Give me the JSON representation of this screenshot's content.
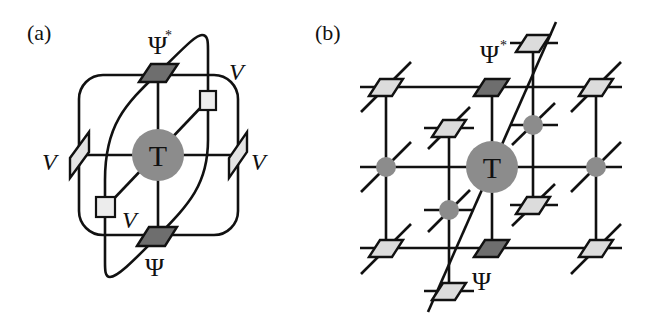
{
  "figure": {
    "panels": [
      {
        "id": "a",
        "label": "(a)",
        "center_tensor": "T",
        "top_tensor": "Ψ",
        "top_tensor_sup": "*",
        "bottom_tensor": "Ψ",
        "v_labels": [
          "V",
          "V",
          "V",
          "V"
        ]
      },
      {
        "id": "b",
        "label": "(b)",
        "center_tensor": "T",
        "top_tensor": "Ψ",
        "top_tensor_sup": "*",
        "bottom_tensor": "Ψ"
      }
    ],
    "colors": {
      "line": "#111111",
      "tensor_T": "#8c8c8c",
      "psi_dark": "#6e6e6e",
      "light_fill": "#dcdcdc",
      "square_fill": "#ececec",
      "small_node": "#8c8c8c"
    }
  }
}
